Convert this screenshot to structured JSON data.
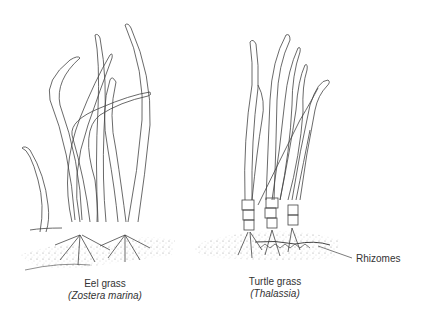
{
  "figure": {
    "plants": [
      {
        "common_name": "Eel grass",
        "scientific_name": "(Zostera marina)"
      },
      {
        "common_name": "Turtle grass",
        "scientific_name": "(Thalassia)"
      }
    ],
    "annotations": [
      {
        "label": "Rhizomes",
        "points_to": "Turtle grass root mass"
      }
    ]
  }
}
